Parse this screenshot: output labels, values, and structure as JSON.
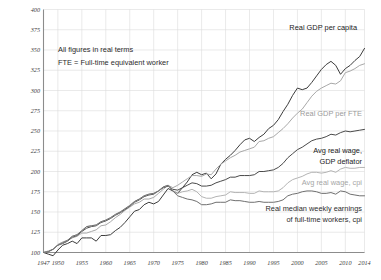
{
  "chart_data": {
    "type": "line",
    "title": "",
    "xlabel": "",
    "ylabel": "",
    "xlim": [
      1947,
      2014
    ],
    "ylim": [
      100,
      400
    ],
    "grid": true,
    "legend_position": "inline-right",
    "y_ticks": [
      100,
      125,
      150,
      175,
      200,
      225,
      250,
      275,
      300,
      325,
      350,
      375,
      400
    ],
    "x_ticks": [
      1947,
      1950,
      1955,
      1960,
      1965,
      1970,
      1975,
      1980,
      1985,
      1990,
      1995,
      2000,
      2005,
      2010,
      2014
    ],
    "annotations": [
      "All figures in real terms",
      "FTE = Full-time equivalent worker"
    ],
    "x": [
      1947,
      1948,
      1949,
      1950,
      1951,
      1952,
      1953,
      1954,
      1955,
      1956,
      1957,
      1958,
      1959,
      1960,
      1961,
      1962,
      1963,
      1964,
      1965,
      1966,
      1967,
      1968,
      1969,
      1970,
      1971,
      1972,
      1973,
      1974,
      1975,
      1976,
      1977,
      1978,
      1979,
      1980,
      1981,
      1982,
      1983,
      1984,
      1985,
      1986,
      1987,
      1988,
      1989,
      1990,
      1991,
      1992,
      1993,
      1994,
      1995,
      1996,
      1997,
      1998,
      1999,
      2000,
      2001,
      2002,
      2003,
      2004,
      2005,
      2006,
      2007,
      2008,
      2009,
      2010,
      2011,
      2012,
      2013,
      2014
    ],
    "series": [
      {
        "name": "Real GDP per capita",
        "color": "#3c3c3c",
        "width": 1.0,
        "label_color": "#222222",
        "end_value": 375,
        "values": [
          100,
          98,
          96,
          103,
          109,
          111,
          114,
          111,
          118,
          118,
          118,
          114,
          121,
          121,
          122,
          127,
          131,
          137,
          144,
          151,
          153,
          159,
          162,
          160,
          163,
          171,
          179,
          176,
          173,
          180,
          187,
          196,
          199,
          196,
          198,
          191,
          197,
          209,
          215,
          220,
          226,
          233,
          239,
          241,
          237,
          242,
          246,
          253,
          257,
          264,
          274,
          283,
          294,
          303,
          301,
          303,
          310,
          318,
          326,
          332,
          336,
          331,
          320,
          327,
          331,
          337,
          342,
          352
        ]
      },
      {
        "name": "Real GDP per FTE",
        "color": "#a8a8a8",
        "width": 1.0,
        "label_color": "#9a9a9a",
        "end_value": 303,
        "values": [
          100,
          102,
          104,
          110,
          113,
          115,
          118,
          120,
          124,
          124,
          126,
          128,
          133,
          134,
          138,
          143,
          147,
          152,
          156,
          160,
          162,
          166,
          166,
          168,
          173,
          178,
          183,
          180,
          183,
          187,
          191,
          195,
          195,
          194,
          197,
          196,
          203,
          209,
          213,
          217,
          220,
          224,
          226,
          228,
          230,
          237,
          238,
          241,
          243,
          248,
          253,
          259,
          266,
          272,
          277,
          285,
          293,
          299,
          303,
          306,
          309,
          308,
          312,
          322,
          324,
          327,
          331,
          333
        ]
      },
      {
        "name": "Avg real wage, GDP deflator",
        "color": "#4a4a4a",
        "width": 1.0,
        "label_color": "#222222",
        "end_value": 252,
        "values": [
          100,
          101,
          104,
          109,
          111,
          114,
          119,
          121,
          126,
          130,
          132,
          133,
          137,
          139,
          142,
          146,
          149,
          153,
          157,
          162,
          165,
          169,
          171,
          172,
          176,
          180,
          182,
          178,
          177,
          180,
          183,
          186,
          185,
          182,
          182,
          183,
          186,
          188,
          190,
          193,
          193,
          195,
          195,
          195,
          196,
          200,
          200,
          201,
          202,
          205,
          210,
          217,
          222,
          227,
          230,
          234,
          238,
          240,
          241,
          243,
          246,
          245,
          248,
          250,
          249,
          250,
          251,
          252
        ]
      },
      {
        "name": "Avg real wage, cpi",
        "color": "#b4b4b4",
        "width": 1.0,
        "label_color": "#a6a6a6",
        "end_value": 205,
        "values": [
          100,
          101,
          104,
          109,
          112,
          115,
          120,
          122,
          127,
          132,
          133,
          134,
          138,
          140,
          143,
          147,
          150,
          154,
          158,
          163,
          166,
          170,
          172,
          173,
          176,
          181,
          183,
          176,
          173,
          175,
          176,
          178,
          175,
          169,
          167,
          167,
          169,
          170,
          171,
          175,
          174,
          174,
          174,
          173,
          173,
          176,
          175,
          175,
          175,
          176,
          180,
          186,
          190,
          192,
          194,
          197,
          199,
          199,
          198,
          199,
          201,
          199,
          203,
          205,
          204,
          204,
          205,
          205
        ]
      },
      {
        "name": "Real median weekly earnings of full-time workers, cpi",
        "color": "#6f6f6f",
        "width": 1.0,
        "label_color": "#2b2b2b",
        "end_value": 170,
        "values": [
          100,
          101,
          104,
          109,
          112,
          115,
          120,
          122,
          127,
          132,
          133,
          134,
          138,
          140,
          143,
          147,
          150,
          154,
          158,
          163,
          166,
          170,
          172,
          173,
          176,
          181,
          183,
          176,
          170,
          168,
          166,
          165,
          163,
          159,
          159,
          160,
          162,
          162,
          162,
          165,
          164,
          164,
          163,
          162,
          162,
          163,
          162,
          162,
          162,
          163,
          165,
          170,
          172,
          173,
          175,
          176,
          176,
          175,
          173,
          173,
          174,
          172,
          176,
          175,
          172,
          171,
          170,
          170
        ]
      }
    ],
    "series_labels": [
      {
        "text": "Real GDP per capita",
        "x": 357,
        "y": 30,
        "color": "#222222"
      },
      {
        "text": "Real GDP per FTE",
        "x": 362,
        "y": 116,
        "color": "#9a9a9a"
      },
      {
        "text": "Avg real wage,",
        "x": 362,
        "y": 153,
        "color": "#222222"
      },
      {
        "text": "GDP deflator",
        "x": 362,
        "y": 164,
        "color": "#222222"
      },
      {
        "text": "Avg real wage, cpi",
        "x": 362,
        "y": 185,
        "color": "#a6a6a6"
      },
      {
        "text": "Real median weekly earnings",
        "x": 362,
        "y": 211,
        "color": "#2b2b2b"
      },
      {
        "text": "of full-time workers, cpi",
        "x": 362,
        "y": 222,
        "color": "#2b2b2b"
      }
    ],
    "colors": {
      "grid": "#dcdcdc",
      "axis": "#8c8c8c",
      "background": "#ffffff",
      "tick_label": "#3a3a3a"
    }
  }
}
